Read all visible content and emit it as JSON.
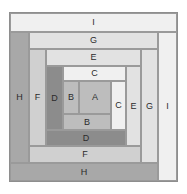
{
  "diagram": {
    "canvas": {
      "width": 187,
      "height": 194
    },
    "background_color": "#ffffff",
    "outline_color": "#8e8e8e",
    "piece_border_color": "#9a9a9a",
    "label_color": "#2b2b2b",
    "palette": {
      "lightest": "#f0f0f0",
      "light": "#e2e2e2",
      "mid": "#d0d0d0",
      "medium": "#bdbdbd",
      "dark": "#a8a8a8",
      "darkest": "#8c8c8c"
    },
    "pieces": [
      {
        "id": "piece-I-top",
        "label": "I",
        "tone": "lightest",
        "x": 10,
        "y": 13,
        "w": 167,
        "h": 19
      },
      {
        "id": "piece-I-right",
        "label": "I",
        "tone": "lightest",
        "x": 158,
        "y": 32,
        "w": 19,
        "h": 149
      },
      {
        "id": "piece-H-left",
        "label": "H",
        "tone": "dark",
        "x": 10,
        "y": 32,
        "w": 19,
        "h": 131
      },
      {
        "id": "piece-H-bottom",
        "label": "H",
        "tone": "dark",
        "x": 10,
        "y": 163,
        "w": 148,
        "h": 18
      },
      {
        "id": "piece-G-top",
        "label": "G",
        "tone": "light",
        "x": 29,
        "y": 32,
        "w": 129,
        "h": 17
      },
      {
        "id": "piece-G-right",
        "label": "G",
        "tone": "light",
        "x": 141,
        "y": 49,
        "w": 17,
        "h": 114
      },
      {
        "id": "piece-F-left",
        "label": "F",
        "tone": "mid",
        "x": 29,
        "y": 49,
        "w": 17,
        "h": 97
      },
      {
        "id": "piece-F-bottom",
        "label": "F",
        "tone": "mid",
        "x": 29,
        "y": 146,
        "w": 112,
        "h": 17
      },
      {
        "id": "piece-E-top",
        "label": "E",
        "tone": "light",
        "x": 46,
        "y": 49,
        "w": 95,
        "h": 17
      },
      {
        "id": "piece-E-right",
        "label": "E",
        "tone": "light",
        "x": 126,
        "y": 66,
        "w": 15,
        "h": 80
      },
      {
        "id": "piece-D-left",
        "label": "D",
        "tone": "darkest",
        "x": 46,
        "y": 66,
        "w": 17,
        "h": 64
      },
      {
        "id": "piece-D-bottom",
        "label": "D",
        "tone": "darkest",
        "x": 46,
        "y": 130,
        "w": 80,
        "h": 16
      },
      {
        "id": "piece-C-top",
        "label": "C",
        "tone": "lightest",
        "x": 63,
        "y": 66,
        "w": 63,
        "h": 15
      },
      {
        "id": "piece-C-right",
        "label": "C",
        "tone": "lightest",
        "x": 111,
        "y": 81,
        "w": 15,
        "h": 49
      },
      {
        "id": "piece-B-left",
        "label": "B",
        "tone": "medium",
        "x": 63,
        "y": 81,
        "w": 16,
        "h": 33
      },
      {
        "id": "piece-B-bottom",
        "label": "B",
        "tone": "medium",
        "x": 63,
        "y": 114,
        "w": 48,
        "h": 16
      },
      {
        "id": "piece-A-center",
        "label": "A",
        "tone": "medium",
        "x": 79,
        "y": 81,
        "w": 32,
        "h": 33
      }
    ]
  }
}
